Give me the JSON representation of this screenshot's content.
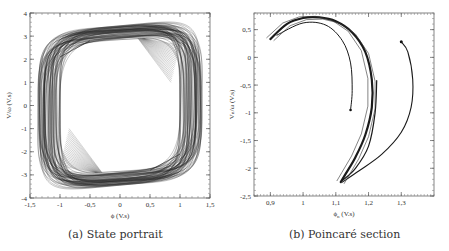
{
  "chart_data": [
    {
      "type": "line",
      "title": "",
      "caption": "(a) State portrait",
      "xlabel": "ϕ (V.s)",
      "ylabel": "V/ω (V.s)",
      "xlim": [
        -1.5,
        1.5
      ],
      "ylim": [
        -4,
        4
      ],
      "xticks": [
        "-1,5",
        "-1",
        "-0,5",
        "0",
        "0,5",
        "1",
        "1,5"
      ],
      "yticks": [
        "4",
        "3",
        "2",
        "1",
        "0",
        "-1",
        "-2",
        "-3",
        "-4"
      ],
      "grid": false,
      "legend": null,
      "description": "Chaotic closed trajectories forming a thick rounded-square band",
      "envelope": {
        "outer": {
          "x_range": [
            -1.38,
            1.38
          ],
          "y_range": [
            -3.45,
            3.45
          ]
        },
        "inner": {
          "x_range": [
            -1.0,
            1.0
          ],
          "y_range": [
            -2.9,
            2.9
          ]
        }
      },
      "series": [
        {
          "name": "trajectory",
          "x": [
            0.0,
            0.6,
            1.0,
            1.3,
            1.35,
            1.3,
            1.0,
            0.6,
            0.0,
            -0.6,
            -1.0,
            -1.3,
            -1.35,
            -1.3,
            -1.0,
            -0.6,
            0.0
          ],
          "y": [
            3.35,
            3.2,
            2.8,
            1.8,
            0.0,
            -1.8,
            -2.6,
            -3.0,
            -3.1,
            -3.0,
            -2.6,
            -1.8,
            0.0,
            1.8,
            2.7,
            3.1,
            3.35
          ]
        }
      ]
    },
    {
      "type": "scatter",
      "title": "",
      "caption": "(b) Poincaré section",
      "xlabel": "ϕₙ (V.s)",
      "ylabel": "Vₙ/ω (V.s)",
      "xlim": [
        0.85,
        1.4
      ],
      "ylim": [
        -2.5,
        0.8
      ],
      "xticks": [
        "0,9",
        "1",
        "1,1",
        "1,2",
        "1,3"
      ],
      "yticks": [
        "0,5",
        "0",
        "-0,5",
        "-1",
        "-1,5",
        "-2",
        "-2,5"
      ],
      "grid": false,
      "legend": null,
      "series": [
        {
          "name": "outer-arc",
          "x": [
            0.9,
            0.95,
            1.0,
            1.05,
            1.1,
            1.15,
            1.19,
            1.21,
            1.21,
            1.19,
            1.16,
            1.13,
            1.115
          ],
          "y": [
            0.33,
            0.6,
            0.71,
            0.72,
            0.65,
            0.45,
            0.1,
            -0.4,
            -0.9,
            -1.4,
            -1.8,
            -2.1,
            -2.25
          ]
        },
        {
          "name": "inner-arc",
          "x": [
            0.92,
            1.0,
            1.07,
            1.12,
            1.145,
            1.15,
            1.145
          ],
          "y": [
            0.4,
            0.62,
            0.58,
            0.3,
            -0.1,
            -0.6,
            -0.95
          ]
        },
        {
          "name": "short-branch",
          "x": [
            1.225,
            1.22,
            1.2,
            1.16,
            1.12
          ],
          "y": [
            -0.42,
            -1.0,
            -1.6,
            -2.0,
            -2.22
          ]
        },
        {
          "name": "right-loop",
          "x": [
            1.3,
            1.32,
            1.335,
            1.33,
            1.3,
            1.24,
            1.17,
            1.12
          ],
          "y": [
            0.28,
            0.1,
            -0.4,
            -0.9,
            -1.35,
            -1.75,
            -2.05,
            -2.25
          ]
        }
      ]
    }
  ],
  "panels": {
    "a": {
      "caption": "(a) State portrait",
      "xlabel": "ϕ (V.s)",
      "ylabel": "V/ω (V.s)"
    },
    "b": {
      "caption": "(b) Poincaré section",
      "xlabel_main": "ϕ",
      "xlabel_sub": "n",
      "xlabel_unit": " (V.s)",
      "ylabel": "Vₙ/ω (V.s)"
    }
  }
}
